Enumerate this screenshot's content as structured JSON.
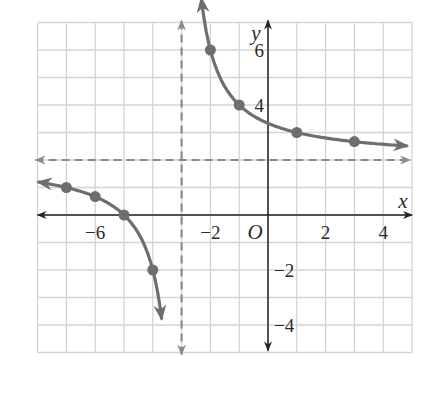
{
  "chart_data": {
    "type": "line",
    "title": "",
    "function": "y = 4/(x+3) + 2",
    "xlabel": "x",
    "ylabel": "y",
    "origin_label": "O",
    "xlim": [
      -8,
      5
    ],
    "ylim": [
      -5,
      7
    ],
    "grid": true,
    "x_tick_labels": [
      {
        "value": -6,
        "label": "−6"
      },
      {
        "value": -2,
        "label": "−2"
      },
      {
        "value": 2,
        "label": "2"
      },
      {
        "value": 4,
        "label": "4"
      }
    ],
    "y_tick_labels": [
      {
        "value": 6,
        "label": "6"
      },
      {
        "value": 4,
        "label": "4"
      },
      {
        "value": -2,
        "label": "−2"
      },
      {
        "value": -4,
        "label": "−4"
      }
    ],
    "asymptotes": {
      "vertical": -3,
      "horizontal": 2,
      "style": "dashed"
    },
    "series": [
      {
        "name": "right branch",
        "points": [
          [
            -2,
            6
          ],
          [
            -1,
            4
          ],
          [
            1,
            3
          ],
          [
            3,
            2.67
          ]
        ]
      },
      {
        "name": "left branch",
        "points": [
          [
            -7,
            1
          ],
          [
            -6,
            0.67
          ],
          [
            -5,
            0
          ],
          [
            -4,
            -2
          ]
        ]
      }
    ],
    "colors": {
      "curve": "#6e6e6e",
      "asymptote": "#8a8a8a",
      "axis": "#222222",
      "grid": "#d4d4d4"
    }
  }
}
